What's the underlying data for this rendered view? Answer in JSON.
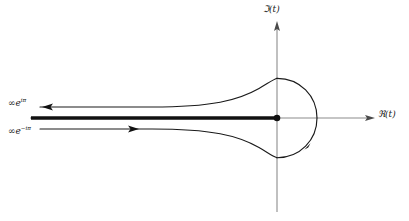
{
  "figure": {
    "background_color": "#ffffff",
    "line_color": "#1a1a1a",
    "axis_color": "#8c8c8c",
    "width": 409,
    "height": 221
  },
  "axes": {
    "imaginary": {
      "label_prefix": "ℑ",
      "label_arg": "(t)",
      "name": "imaginary-axis",
      "x": 277,
      "y_top": 22,
      "y_bottom": 212,
      "arrow": "up"
    },
    "real": {
      "label_prefix": "ℜ",
      "label_arg": "(t)",
      "name": "real-axis",
      "y": 118,
      "x_left": 30,
      "x_right": 374,
      "arrow": "right"
    }
  },
  "labels": {
    "upper_ray": {
      "infinity": "∞",
      "base": "e",
      "exponent": "iπ"
    },
    "lower_ray": {
      "infinity": "∞",
      "base": "e",
      "exponent": "−iπ"
    }
  },
  "branch_cut": {
    "name": "branch-cut",
    "x_start": 31,
    "x_end": 277,
    "y": 118,
    "stroke_width": 3.4
  },
  "origin_marker": {
    "name": "origin-dot",
    "x": 277,
    "y": 118,
    "radius": 3.2
  },
  "contour": {
    "name": "hankel-contour",
    "stroke_width": 1.1,
    "upper_path": "M 44 107 L 150 107 C 210 107 236 100 258 88 C 268 82 272 79 277 78",
    "lower_path": "M 44 129 L 150 129 C 210 129 236 136 258 148 C 268 154 272 157 277 158",
    "loop_right": "M 277 78 C 300 78 317 96 317 118 C 317 140 300 158 277 158",
    "arrows": [
      {
        "name": "arrow-upper-ray",
        "x": 44,
        "y": 107,
        "direction": "left"
      },
      {
        "name": "arrow-lower-ray",
        "x": 137,
        "y": 129,
        "direction": "right"
      },
      {
        "name": "arrow-loop",
        "x": 306,
        "y": 148,
        "direction": "down-left"
      }
    ]
  }
}
